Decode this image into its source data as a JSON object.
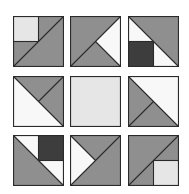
{
  "diagram": {
    "type": "quilt-block-grid",
    "rows": 3,
    "cols": 3,
    "colors": {
      "gray": "#8f8f8f",
      "light": "#e6e6e6",
      "white": "#f8f8f8",
      "dark": "#3d3d3d",
      "line": "#2a2a2a"
    },
    "tiles": [
      {
        "id": "t1",
        "row": 0,
        "col": 0,
        "left": 0,
        "top": 0,
        "shapes": [
          {
            "fill": "gray",
            "points": "0,0 100,0 100,100 0,100"
          },
          {
            "fill": "light",
            "points": "0,0 50,0 50,50 0,50"
          }
        ],
        "lines": [
          [
            0,
            100,
            100,
            0
          ],
          [
            50,
            0,
            50,
            50
          ],
          [
            0,
            50,
            50,
            50
          ]
        ]
      },
      {
        "id": "t2",
        "row": 0,
        "col": 1,
        "left": 57,
        "top": 0,
        "shapes": [
          {
            "fill": "gray",
            "points": "0,0 100,0 100,100 0,100"
          },
          {
            "fill": "white",
            "points": "100,0 50,50 100,100"
          }
        ],
        "lines": [
          [
            0,
            100,
            100,
            0
          ],
          [
            50,
            50,
            100,
            100
          ]
        ]
      },
      {
        "id": "t3",
        "row": 0,
        "col": 2,
        "left": 115,
        "top": 0,
        "shapes": [
          {
            "fill": "white",
            "points": "0,0 100,0 100,100 0,100"
          },
          {
            "fill": "gray",
            "points": "0,0 100,0 100,100"
          },
          {
            "fill": "dark",
            "points": "0,50 50,50 50,100 0,100"
          }
        ],
        "lines": [
          [
            0,
            0,
            100,
            100
          ],
          [
            0,
            50,
            50,
            50
          ],
          [
            50,
            50,
            50,
            100
          ]
        ]
      },
      {
        "id": "t4",
        "row": 1,
        "col": 0,
        "left": 0,
        "top": 60,
        "shapes": [
          {
            "fill": "white",
            "points": "0,0 100,0 100,100 0,100"
          },
          {
            "fill": "gray",
            "points": "0,0 100,0 100,100"
          }
        ],
        "lines": [
          [
            0,
            0,
            100,
            100
          ],
          [
            50,
            50,
            100,
            0
          ]
        ]
      },
      {
        "id": "t5",
        "row": 1,
        "col": 1,
        "left": 57,
        "top": 60,
        "shapes": [
          {
            "fill": "light",
            "points": "0,0 100,0 100,100 0,100"
          }
        ],
        "lines": []
      },
      {
        "id": "t6",
        "row": 1,
        "col": 2,
        "left": 115,
        "top": 60,
        "shapes": [
          {
            "fill": "white",
            "points": "0,0 100,0 100,100 0,100"
          },
          {
            "fill": "gray",
            "points": "0,0 100,100 0,100"
          }
        ],
        "lines": [
          [
            0,
            0,
            100,
            100
          ],
          [
            50,
            50,
            0,
            100
          ]
        ]
      },
      {
        "id": "t7",
        "row": 2,
        "col": 0,
        "left": 0,
        "top": 119,
        "shapes": [
          {
            "fill": "white",
            "points": "0,0 100,0 100,100 0,100"
          },
          {
            "fill": "gray",
            "points": "0,0 100,100 0,100"
          },
          {
            "fill": "dark",
            "points": "50,0 100,0 100,50 50,50"
          }
        ],
        "lines": [
          [
            0,
            0,
            100,
            100
          ],
          [
            50,
            0,
            50,
            50
          ],
          [
            50,
            50,
            100,
            50
          ]
        ]
      },
      {
        "id": "t8",
        "row": 2,
        "col": 1,
        "left": 57,
        "top": 119,
        "shapes": [
          {
            "fill": "gray",
            "points": "0,0 100,0 100,100 0,100"
          },
          {
            "fill": "white",
            "points": "0,0 50,50 0,100"
          }
        ],
        "lines": [
          [
            0,
            0,
            50,
            50
          ],
          [
            0,
            100,
            100,
            0
          ]
        ]
      },
      {
        "id": "t9",
        "row": 2,
        "col": 2,
        "left": 115,
        "top": 119,
        "shapes": [
          {
            "fill": "gray",
            "points": "0,0 100,0 100,100 0,100"
          },
          {
            "fill": "light",
            "points": "50,50 100,50 100,100 50,100"
          }
        ],
        "lines": [
          [
            0,
            100,
            100,
            0
          ],
          [
            50,
            50,
            100,
            50
          ],
          [
            50,
            50,
            50,
            100
          ]
        ]
      }
    ]
  }
}
